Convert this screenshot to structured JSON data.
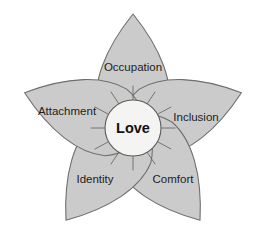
{
  "diagram": {
    "type": "radial-petal-diagram",
    "center": {
      "label": "Love",
      "shape": "circle",
      "fill_color": "#f4f4f2",
      "stroke_color": "#5e5e5e"
    },
    "petal_style": {
      "fill_color": "#cbcbcb",
      "stroke_color": "#6f6f6f"
    },
    "background_color": "#ffffff",
    "petal_count": 5,
    "petals": [
      {
        "label": "Occupation",
        "position": "top",
        "angle_deg": 0,
        "label_x": 133,
        "label_y": 68
      },
      {
        "label": "Inclusion",
        "position": "upper-right",
        "angle_deg": 72,
        "label_x": 196,
        "label_y": 118
      },
      {
        "label": "Comfort",
        "position": "lower-right",
        "angle_deg": 144,
        "label_x": 173,
        "label_y": 180
      },
      {
        "label": "Identity",
        "position": "lower-left",
        "angle_deg": 216,
        "label_x": 95,
        "label_y": 180
      },
      {
        "label": "Attachment",
        "position": "upper-left",
        "angle_deg": 288,
        "label_x": 67,
        "label_y": 112
      }
    ]
  }
}
